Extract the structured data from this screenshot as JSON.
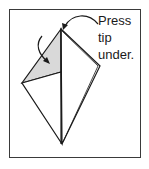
{
  "diagram": {
    "type": "origami-step",
    "instruction_lines": [
      "Press",
      "tip",
      "under."
    ],
    "colors": {
      "frame": "#3a3a3a",
      "line": "#1a1a1a",
      "shaded_flap": "#d9d9d9",
      "paper": "#ffffff"
    },
    "icons": [
      "curved-arrow-fold-icon",
      "curved-arrow-press-icon"
    ]
  }
}
